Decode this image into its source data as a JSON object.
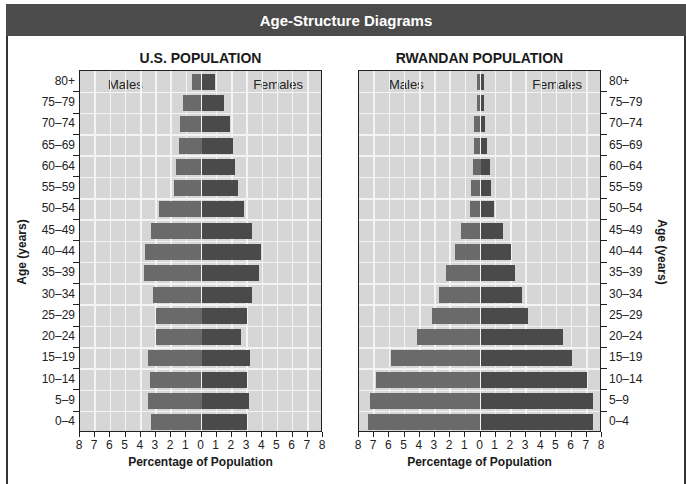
{
  "header": {
    "title": "Age-Structure Diagrams"
  },
  "colors": {
    "header_bg": "#4b4b4b",
    "plot_bg": "#d6d6d6",
    "grid": "#f4f4f4",
    "male_bar": "#6a6a6a",
    "female_bar": "#4a4a4a"
  },
  "labels": {
    "males": "Males",
    "females": "Females",
    "x_axis": "Percentage of Population",
    "y_axis": "Age (years)"
  },
  "x_ticks": [
    "8",
    "7",
    "6",
    "5",
    "4",
    "3",
    "2",
    "1",
    "0",
    "1",
    "2",
    "3",
    "4",
    "5",
    "6",
    "7",
    "8"
  ],
  "chart_data": [
    {
      "type": "bar",
      "subtype": "population-pyramid",
      "title": "U.S. POPULATION",
      "xlabel": "Percentage of Population",
      "ylabel": "Age (years)",
      "xlim": [
        -8,
        8
      ],
      "grid": true,
      "categories": [
        "80+",
        "75–79",
        "70–74",
        "65–69",
        "60–64",
        "55–59",
        "50–54",
        "45–49",
        "40–44",
        "35–39",
        "30–34",
        "25–29",
        "20–24",
        "15–19",
        "10–14",
        "5–9",
        "0–4"
      ],
      "series": [
        {
          "name": "Males",
          "values": [
            0.6,
            1.2,
            1.4,
            1.5,
            1.7,
            1.8,
            2.8,
            3.3,
            3.7,
            3.8,
            3.2,
            3.0,
            3.0,
            3.5,
            3.4,
            3.5,
            3.3
          ]
        },
        {
          "name": "Females",
          "values": [
            0.9,
            1.5,
            1.9,
            2.1,
            2.2,
            2.4,
            2.8,
            3.3,
            3.9,
            3.8,
            3.3,
            3.0,
            2.6,
            3.2,
            3.0,
            3.1,
            3.0
          ]
        }
      ]
    },
    {
      "type": "bar",
      "subtype": "population-pyramid",
      "title": "RWANDAN POPULATION",
      "xlabel": "Percentage of Population",
      "ylabel": "Age (years)",
      "xlim": [
        -8,
        8
      ],
      "grid": true,
      "categories": [
        "80+",
        "75–79",
        "70–74",
        "65–69",
        "60–64",
        "55–59",
        "50–54",
        "45–49",
        "40–44",
        "35–39",
        "30–34",
        "25–29",
        "20–24",
        "15–19",
        "10–14",
        "5–9",
        "0–4"
      ],
      "series": [
        {
          "name": "Males",
          "values": [
            0.2,
            0.2,
            0.4,
            0.4,
            0.5,
            0.6,
            0.7,
            1.3,
            1.7,
            2.3,
            2.7,
            3.2,
            4.2,
            5.9,
            6.9,
            7.3,
            7.4
          ]
        },
        {
          "name": "Females",
          "values": [
            0.2,
            0.2,
            0.3,
            0.4,
            0.6,
            0.7,
            0.9,
            1.5,
            2.0,
            2.3,
            2.7,
            3.1,
            5.4,
            6.0,
            7.0,
            7.4,
            7.4
          ]
        }
      ]
    }
  ]
}
